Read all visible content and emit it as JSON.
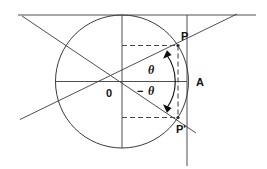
{
  "figure": {
    "kind": "geometry-diagram",
    "background_color": "#ffffff",
    "line_color": "#3a3a3a",
    "accent_color": "#0d0d0d",
    "width": 267,
    "height": 169
  },
  "labels": {
    "center": "0",
    "point_upper": "P",
    "point_lower": "P'",
    "point_axis": "A",
    "angle_positive": "θ",
    "angle_negative_sign": "−",
    "angle_negative": "θ"
  },
  "geometry": {
    "circle": {
      "cx": 122,
      "cy": 81.5,
      "r": 66.5
    },
    "center_point": {
      "x": 122,
      "y": 81.5
    },
    "point_P": {
      "x": 178,
      "y": 45.5
    },
    "point_P_prime": {
      "x": 178,
      "y": 117.5
    },
    "point_A": {
      "x": 187,
      "y": 81.5
    },
    "horizontal_axis": {
      "x1": 55,
      "y1": 81.5,
      "x2": 187,
      "y2": 81.5
    },
    "vertical_axis": {
      "x1": 122,
      "y1": 15,
      "x2": 122,
      "y2": 148
    },
    "tangent_top": {
      "x1": 18,
      "y1": 15,
      "x2": 256,
      "y2": 15
    },
    "tangent_right": {
      "x1": 187,
      "y1": 15,
      "x2": 187,
      "y2": 166
    },
    "secant_up": {
      "x1": 20,
      "y1": 139,
      "x2": 237,
      "y2": 14
    },
    "secant_down": {
      "x1": 22,
      "y1": 16,
      "x2": 196,
      "y2": 133
    },
    "dashed_vertical": {
      "x": 178,
      "y1": 45.5,
      "y2": 117.5
    },
    "dashed_upper": {
      "x1": 122,
      "y1": 45.5,
      "x2": 178,
      "y2": 45.5
    },
    "dashed_lower": {
      "x1": 122,
      "y1": 117.5,
      "x2": 178,
      "y2": 117.5
    },
    "angle_degrees": 33,
    "arc_radius": 46
  }
}
